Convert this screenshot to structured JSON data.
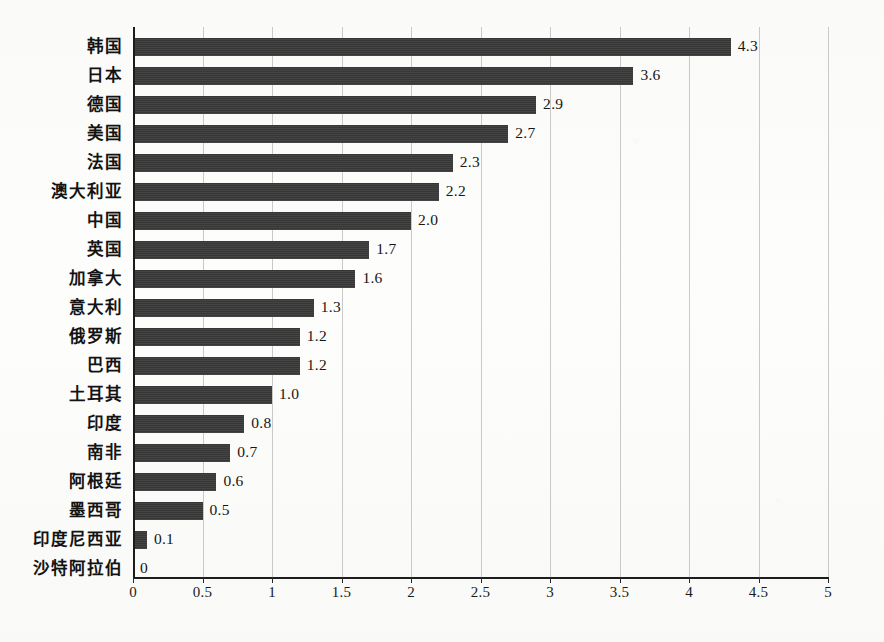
{
  "chart_data": {
    "type": "bar",
    "orientation": "horizontal",
    "title": "",
    "subtitle": "",
    "xlabel": "",
    "ylabel": "",
    "xlim": [
      0,
      5
    ],
    "xticks": [
      "0",
      "0.5",
      "1",
      "1.5",
      "2",
      "2.5",
      "3",
      "3.5",
      "4",
      "4.5",
      "5"
    ],
    "xtick_values": [
      0,
      0.5,
      1,
      1.5,
      2,
      2.5,
      3,
      3.5,
      4,
      4.5,
      5
    ],
    "grid": "vertical",
    "legend": "none",
    "categories": [
      "韩国",
      "日本",
      "德国",
      "美国",
      "法国",
      "澳大利亚",
      "中国",
      "英国",
      "加拿大",
      "意大利",
      "俄罗斯",
      "巴西",
      "土耳其",
      "印度",
      "南非",
      "阿根廷",
      "墨西哥",
      "印度尼西亚",
      "沙特阿拉伯"
    ],
    "values": [
      4.3,
      3.6,
      2.9,
      2.7,
      2.3,
      2.2,
      2.0,
      1.7,
      1.6,
      1.3,
      1.2,
      1.2,
      1.0,
      0.8,
      0.7,
      0.6,
      0.5,
      0.1,
      0
    ],
    "data_labels": [
      "4.3",
      "3.6",
      "2.9",
      "2.7",
      "2.3",
      "2.2",
      "2.0",
      "1.7",
      "1.6",
      "1.3",
      "1.2",
      "1.2",
      "1.0",
      "0.8",
      "0.7",
      "0.6",
      "0.5",
      "0.1",
      "0"
    ],
    "colors": {
      "bar": "#3a3a3a",
      "axis": "#1c1c1c",
      "gridline": "#c9c9c9",
      "text": "#121212",
      "background": "#fdfdfc"
    }
  }
}
